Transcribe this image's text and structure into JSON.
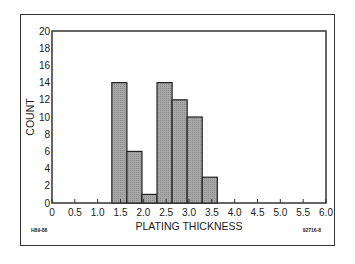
{
  "chart_data": {
    "type": "bar",
    "subtype": "histogram",
    "title": "",
    "xlabel": "PLATING THICKNESS",
    "ylabel": "COUNT",
    "xlim": [
      0,
      6.0
    ],
    "ylim": [
      0,
      20
    ],
    "x_ticks": [
      "0",
      "0.5",
      "1.0",
      "1.5",
      "2.0",
      "2.5",
      "3.0",
      "3.5",
      "4.0",
      "4.5",
      "5.0",
      "5.5",
      "6.0"
    ],
    "y_ticks": [
      "0",
      "2",
      "4",
      "6",
      "8",
      "10",
      "12",
      "14",
      "16",
      "18",
      "20"
    ],
    "bins": [
      {
        "x_start": 1.31,
        "x_end": 1.64,
        "count": 14
      },
      {
        "x_start": 1.64,
        "x_end": 1.97,
        "count": 6
      },
      {
        "x_start": 1.97,
        "x_end": 2.3,
        "count": 1
      },
      {
        "x_start": 2.3,
        "x_end": 2.63,
        "count": 14
      },
      {
        "x_start": 2.63,
        "x_end": 2.96,
        "count": 12
      },
      {
        "x_start": 2.96,
        "x_end": 3.29,
        "count": 10
      },
      {
        "x_start": 3.29,
        "x_end": 3.62,
        "count": 3
      }
    ],
    "categories": [
      "1.3-1.6",
      "1.6-2.0",
      "2.0-2.3",
      "2.3-2.6",
      "2.6-3.0",
      "3.0-3.3",
      "3.3-3.6"
    ],
    "values": [
      14,
      6,
      1,
      14,
      12,
      10,
      3
    ],
    "grid": false,
    "legend": null,
    "bar_fill": "#9a9a9a",
    "bar_edge": "#222222"
  },
  "annotations": {
    "left_code": "H89-88",
    "right_code": "92716-8"
  }
}
